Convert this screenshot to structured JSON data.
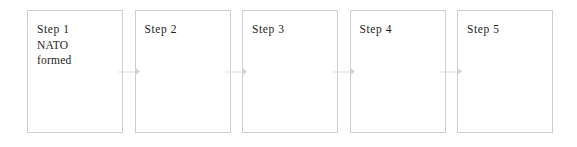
{
  "diagram": {
    "type": "process-flow",
    "orientation": "horizontal",
    "title": "",
    "colors": {
      "background": "#ffffff",
      "box_border": "#cdcdcd",
      "box_fill": "#ffffff",
      "text": "#1c1c1c",
      "arrow": "#dcdcdc"
    },
    "steps": [
      {
        "id": "step-1",
        "label": "Step 1",
        "lines": [
          "Step 1",
          "NATO",
          "formed"
        ]
      },
      {
        "id": "step-2",
        "label": "Step 2",
        "lines": [
          "Step 2"
        ]
      },
      {
        "id": "step-3",
        "label": "Step 3",
        "lines": [
          "Step 3"
        ]
      },
      {
        "id": "step-4",
        "label": "Step 4",
        "lines": [
          "Step 4"
        ]
      },
      {
        "id": "step-5",
        "label": "Step 5",
        "lines": [
          "Step 5"
        ]
      }
    ],
    "connectors": [
      {
        "id": "connector-1-2",
        "icon": "arrow-right-icon",
        "from": "step-1",
        "to": "step-2"
      },
      {
        "id": "connector-2-3",
        "icon": "arrow-right-icon",
        "from": "step-2",
        "to": "step-3"
      },
      {
        "id": "connector-3-4",
        "icon": "arrow-right-icon",
        "from": "step-3",
        "to": "step-4"
      },
      {
        "id": "connector-4-5",
        "icon": "arrow-right-icon",
        "from": "step-4",
        "to": "step-5"
      }
    ]
  }
}
